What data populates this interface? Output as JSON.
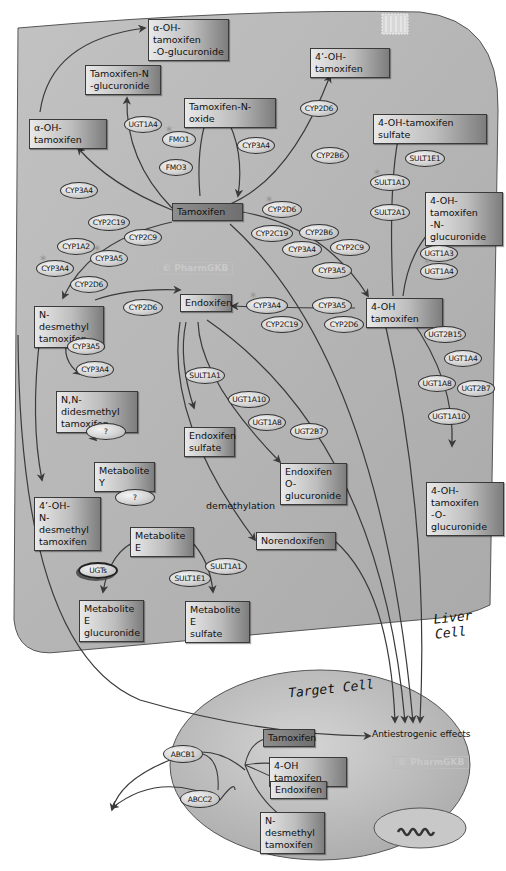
{
  "colors": {
    "liver_cell_fill": "#b9b9b9",
    "target_cell_fill": "#c2c2c2",
    "arrow": "#3a3a3a",
    "background": "#ffffff"
  },
  "cells": {
    "liver": {
      "label": "Liver Cell"
    },
    "target": {
      "label": "Target Cell"
    }
  },
  "watermarks": {
    "liver": "© PharmGKB",
    "target": "© PharmGKB"
  },
  "metabolites": {
    "tamoxifen": "Tamoxifen",
    "alpha_oh_tam_o_gluc": "α-OH-tamoxifen\n-O-glucuronide",
    "tam_n_gluc": "Tamoxifen-N\n-glucuronide",
    "tam_n_oxide": "Tamoxifen-N-oxide",
    "four_prime_oh_tam": "4’-OH-tamoxifen",
    "alpha_oh_tam": "α-OH-tamoxifen",
    "four_oh_tam_sulfate": "4-OH-tamoxifen sulfate",
    "four_oh_tam_n_gluc": "4-OH-tamoxifen\n-N-glucuronide",
    "n_desmethyl_tam": "N-desmethyl\ntamoxifen",
    "endoxifen": "Endoxifen",
    "four_oh_tam": "4-OH tamoxifen",
    "nn_didesmethyl_tam": "N,N-didesmethyl\ntamoxifen",
    "endoxifen_sulfate": "Endoxifen\nsulfate",
    "endoxifen_o_gluc": "Endoxifen\nO-glucuronide",
    "four_oh_tam_o_gluc": "4-OH-tamoxifen\n-O-glucuronide",
    "metabolite_y": "Metabolite Y",
    "four_prime_oh_n_desmethyl": "4’-OH-\nN-desmethyl\ntamoxifen",
    "metabolite_e": "Metabolite E",
    "norendoxifen": "Norendoxifen",
    "metabolite_e_gluc": "Metabolite E\nglucuronide",
    "metabolite_e_sulfate": "Metabolite E\nsulfate"
  },
  "target_cell_metabolites": {
    "tamoxifen": "Tamoxifen",
    "four_oh_tam": "4-OH tamoxifen",
    "endoxifen": "Endoxifen",
    "n_desmethyl_tam": "N-desmethyl\ntamoxifen"
  },
  "annotations": {
    "demethylation": "demethylation",
    "antiestrogenic": "Antiestrogenic effects"
  },
  "enzymes": [
    {
      "id": "ugt1a4_a",
      "label": "UGT1A4",
      "x": 124,
      "y": 116,
      "w": 38,
      "h": 17,
      "star": false
    },
    {
      "id": "fmo1",
      "label": "FMO1",
      "x": 162,
      "y": 131,
      "w": 34,
      "h": 17,
      "star": true
    },
    {
      "id": "fmo3",
      "label": "FMO3",
      "x": 159,
      "y": 159,
      "w": 34,
      "h": 17,
      "star": false
    },
    {
      "id": "cyp3a4_n_ox",
      "label": "CYP3A4",
      "x": 237,
      "y": 137,
      "w": 38,
      "h": 17,
      "star": false
    },
    {
      "id": "cyp2d6_4p",
      "label": "CYP2D6",
      "x": 300,
      "y": 100,
      "w": 38,
      "h": 17,
      "star": false
    },
    {
      "id": "cyp2b6_4p",
      "label": "CYP2B6",
      "x": 311,
      "y": 147,
      "w": 38,
      "h": 17,
      "star": false
    },
    {
      "id": "cyp3a4_alpha",
      "label": "CYP3A4",
      "x": 60,
      "y": 182,
      "w": 38,
      "h": 17,
      "star": false
    },
    {
      "id": "sult1e1_a",
      "label": "SULT1E1",
      "x": 405,
      "y": 150,
      "w": 40,
      "h": 17,
      "star": false
    },
    {
      "id": "sult1a1_a",
      "label": "SULT1A1",
      "x": 370,
      "y": 174,
      "w": 40,
      "h": 17,
      "star": true
    },
    {
      "id": "sult2a1",
      "label": "SULT2A1",
      "x": 370,
      "y": 204,
      "w": 40,
      "h": 17,
      "star": false
    },
    {
      "id": "cyp2c19_nd",
      "label": "CYP2C19",
      "x": 88,
      "y": 214,
      "w": 42,
      "h": 17,
      "star": false
    },
    {
      "id": "cyp2c9_nd",
      "label": "CYP2C9",
      "x": 124,
      "y": 229,
      "w": 38,
      "h": 17,
      "star": false
    },
    {
      "id": "cyp1a2_nd",
      "label": "CYP1A2",
      "x": 57,
      "y": 238,
      "w": 38,
      "h": 17,
      "star": false
    },
    {
      "id": "cyp3a5_nd",
      "label": "CYP3A5",
      "x": 90,
      "y": 250,
      "w": 38,
      "h": 17,
      "star": true
    },
    {
      "id": "cyp3a4_nd",
      "label": "CYP3A4",
      "x": 36,
      "y": 260,
      "w": 38,
      "h": 17,
      "star": true
    },
    {
      "id": "cyp2d6_nd",
      "label": "CYP2D6",
      "x": 70,
      "y": 276,
      "w": 38,
      "h": 17,
      "star": false
    },
    {
      "id": "cyp2d6_4oh",
      "label": "CYP2D6",
      "x": 262,
      "y": 201,
      "w": 40,
      "h": 17,
      "star": true
    },
    {
      "id": "cyp2c19_4oh",
      "label": "CYP2C19",
      "x": 251,
      "y": 225,
      "w": 42,
      "h": 17,
      "star": false
    },
    {
      "id": "cyp2b6_4oh",
      "label": "CYP2B6",
      "x": 299,
      "y": 224,
      "w": 40,
      "h": 17,
      "star": false
    },
    {
      "id": "cyp3a4_4oh",
      "label": "CYP3A4",
      "x": 282,
      "y": 241,
      "w": 40,
      "h": 17,
      "star": false
    },
    {
      "id": "cyp2c9_4oh",
      "label": "CYP2C9",
      "x": 330,
      "y": 239,
      "w": 40,
      "h": 17,
      "star": false
    },
    {
      "id": "cyp3a5_4oh",
      "label": "CYP3A5",
      "x": 312,
      "y": 262,
      "w": 40,
      "h": 17,
      "star": false
    },
    {
      "id": "ugt1a3",
      "label": "UGT1A3",
      "x": 420,
      "y": 245,
      "w": 38,
      "h": 17,
      "star": false
    },
    {
      "id": "ugt1a4_b",
      "label": "UGT1A4",
      "x": 420,
      "y": 263,
      "w": 38,
      "h": 17,
      "star": true
    },
    {
      "id": "cyp2d6_endo",
      "label": "CYP2D6",
      "x": 123,
      "y": 299,
      "w": 40,
      "h": 17,
      "star": false
    },
    {
      "id": "cyp3a4_endo",
      "label": "CYP3A4",
      "x": 246,
      "y": 297,
      "w": 42,
      "h": 17,
      "star": true
    },
    {
      "id": "cyp3a5_endo",
      "label": "CYP3A5",
      "x": 312,
      "y": 297,
      "w": 40,
      "h": 17,
      "star": false
    },
    {
      "id": "cyp2c19_endo",
      "label": "CYP2C19",
      "x": 261,
      "y": 316,
      "w": 42,
      "h": 17,
      "star": false
    },
    {
      "id": "cyp2d6_endo2",
      "label": "CYP2D6",
      "x": 324,
      "y": 316,
      "w": 40,
      "h": 17,
      "star": false
    },
    {
      "id": "ugt2b15",
      "label": "UGT2B15",
      "x": 424,
      "y": 326,
      "w": 42,
      "h": 17,
      "star": false
    },
    {
      "id": "ugt1a4_c",
      "label": "UGT1A4",
      "x": 444,
      "y": 350,
      "w": 38,
      "h": 17,
      "star": false
    },
    {
      "id": "ugt1a8_4oh",
      "label": "UGT1A8",
      "x": 418,
      "y": 375,
      "w": 38,
      "h": 17,
      "star": false
    },
    {
      "id": "ugt2b7_4oh",
      "label": "UGT2B7",
      "x": 457,
      "y": 380,
      "w": 38,
      "h": 17,
      "star": false
    },
    {
      "id": "ugt1a10_4oh",
      "label": "UGT1A10",
      "x": 428,
      "y": 408,
      "w": 42,
      "h": 17,
      "star": false
    },
    {
      "id": "cyp3a5_didm",
      "label": "CYP3A5",
      "x": 67,
      "y": 338,
      "w": 38,
      "h": 17,
      "star": false
    },
    {
      "id": "cyp3a4_didm",
      "label": "CYP3A4",
      "x": 76,
      "y": 361,
      "w": 38,
      "h": 17,
      "star": false
    },
    {
      "id": "sult1a1_endo",
      "label": "SULT1A1",
      "x": 185,
      "y": 367,
      "w": 40,
      "h": 17,
      "star": false
    },
    {
      "id": "ugt1a10_endo",
      "label": "UGT1A10",
      "x": 228,
      "y": 391,
      "w": 42,
      "h": 17,
      "star": false
    },
    {
      "id": "ugt1a8_endo",
      "label": "UGT1A8",
      "x": 248,
      "y": 414,
      "w": 38,
      "h": 17,
      "star": false
    },
    {
      "id": "ugt2b7_endo",
      "label": "UGT2B7",
      "x": 290,
      "y": 423,
      "w": 38,
      "h": 17,
      "star": false
    },
    {
      "id": "q1",
      "label": "?",
      "x": 86,
      "y": 423,
      "w": 40,
      "h": 17,
      "star": false
    },
    {
      "id": "q2",
      "label": "?",
      "x": 115,
      "y": 489,
      "w": 40,
      "h": 17,
      "star": false
    },
    {
      "id": "ugts",
      "label": "UGTs",
      "x": 78,
      "y": 562,
      "w": 40,
      "h": 17,
      "star": false,
      "ugts": true
    },
    {
      "id": "sult1a1_me",
      "label": "SULT1A1",
      "x": 205,
      "y": 558,
      "w": 42,
      "h": 17,
      "star": false
    },
    {
      "id": "sult1e1_me",
      "label": "SULT1E1",
      "x": 169,
      "y": 570,
      "w": 42,
      "h": 17,
      "star": false
    },
    {
      "id": "abcb1",
      "label": "ABCB1",
      "x": 163,
      "y": 745,
      "w": 40,
      "h": 18,
      "star": false
    },
    {
      "id": "abcc2",
      "label": "ABCC2",
      "x": 180,
      "y": 790,
      "w": 40,
      "h": 18,
      "star": false
    }
  ]
}
